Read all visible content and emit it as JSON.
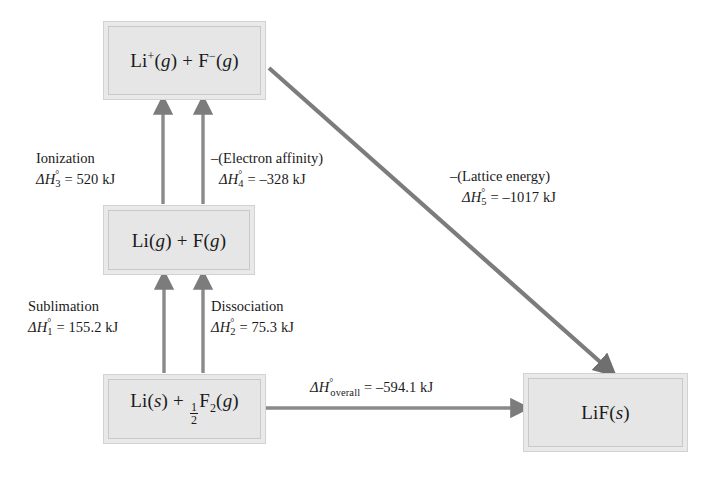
{
  "diagram": {
    "accent_arrow_color": "#7a7a7a",
    "box_fill_color": "#e9e9e9",
    "box_border_color": "#cccccc",
    "text_color": "#1a1a1a"
  },
  "boxes": {
    "ions_gas": {
      "name": "Li+(g) + F-(g)"
    },
    "atoms_gas": {
      "name": "Li(g) + F(g)"
    },
    "reactants": {
      "name": "Li(s) + 1/2 F2(g)"
    },
    "product": {
      "name": "LiF(s)"
    }
  },
  "steps": [
    {
      "id": "sublimation",
      "label": "Sublimation",
      "symbol": "ΔH°₁",
      "value": "= 155.2 kJ",
      "enthalpy_kJ": 155.2
    },
    {
      "id": "dissociation",
      "label": "Dissociation",
      "symbol": "ΔH°₂",
      "value": "= 75.3 kJ",
      "enthalpy_kJ": 75.3
    },
    {
      "id": "ionization",
      "label": "Ionization",
      "symbol": "ΔH°₃",
      "value": "= 520 kJ",
      "enthalpy_kJ": 520
    },
    {
      "id": "electron-affinity",
      "label": "–(Electron affinity)",
      "symbol": "ΔH°₄",
      "value": "= –328 kJ",
      "enthalpy_kJ": -328
    },
    {
      "id": "lattice-energy",
      "label": "–(Lattice energy)",
      "symbol": "ΔH°₅",
      "value": "= –1017 kJ",
      "enthalpy_kJ": -1017
    },
    {
      "id": "overall",
      "label": "",
      "symbol": "ΔH°overall",
      "value": "= –594.1 kJ",
      "enthalpy_kJ": -594.1
    }
  ],
  "annotations": {
    "ionization_label": "Ionization",
    "ionization_value": "= 520 kJ",
    "electron_affinity_label": "–(Electron affinity)",
    "electron_affinity_value": "= –328 kJ",
    "sublimation_label": "Sublimation",
    "sublimation_value": "= 155.2 kJ",
    "dissociation_label": "Dissociation",
    "dissociation_value": "= 75.3 kJ",
    "lattice_label": "–(Lattice energy)",
    "lattice_value": "= –1017 kJ",
    "overall_value": "= –594.1 kJ",
    "overall_sub": "overall"
  },
  "formulas": {
    "li_cation": "Li",
    "plus_sign": "+",
    "f_anion": "F",
    "g_state": "g",
    "s_state": "s",
    "li_symbol": "Li",
    "f_symbol": "F",
    "f2_symbol": "F",
    "f2_sub": "2",
    "half_num": "1",
    "half_den": "2",
    "lif_symbol": "LiF"
  }
}
